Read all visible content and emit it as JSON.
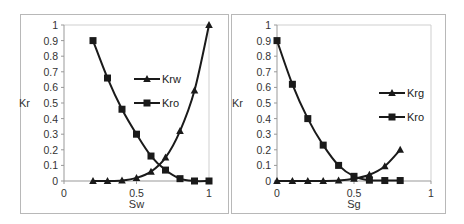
{
  "chart_data": [
    {
      "type": "line",
      "title": "",
      "xlabel": "Sw",
      "ylabel": "Kr",
      "xlim": [
        0,
        1
      ],
      "ylim": [
        0,
        1
      ],
      "x_ticks": [
        "0",
        "0.5",
        "1"
      ],
      "y_ticks": [
        "0",
        "0.1",
        "0.2",
        "0.3",
        "0.4",
        "0.5",
        "0.6",
        "0.7",
        "0.8",
        "0.9",
        "1"
      ],
      "grid": false,
      "legend_position": "inside-right",
      "x": [
        0.2,
        0.3,
        0.4,
        0.5,
        0.6,
        0.7,
        0.8,
        0.9,
        1.0
      ],
      "series": [
        {
          "name": "Krw",
          "marker": "triangle",
          "values": [
            0,
            0,
            0.003,
            0.02,
            0.06,
            0.15,
            0.32,
            0.58,
            1.0
          ]
        },
        {
          "name": "Kro",
          "marker": "square",
          "values": [
            0.9,
            0.66,
            0.46,
            0.3,
            0.16,
            0.07,
            0.015,
            0,
            0
          ]
        }
      ]
    },
    {
      "type": "line",
      "title": "",
      "xlabel": "Sg",
      "ylabel": "Kr",
      "xlim": [
        0,
        1
      ],
      "ylim": [
        0,
        1
      ],
      "x_ticks": [
        "0",
        "0.5",
        "1"
      ],
      "y_ticks": [
        "0",
        "0.1",
        "0.2",
        "0.3",
        "0.4",
        "0.5",
        "0.6",
        "0.7",
        "0.8",
        "0.9",
        "1"
      ],
      "grid": false,
      "legend_position": "inside-right",
      "x": [
        0,
        0.1,
        0.2,
        0.3,
        0.4,
        0.5,
        0.6,
        0.7,
        0.8
      ],
      "series": [
        {
          "name": "Krg",
          "marker": "triangle",
          "values": [
            0,
            0,
            0,
            0,
            0.003,
            0.015,
            0.04,
            0.095,
            0.2
          ]
        },
        {
          "name": "Kro",
          "marker": "square",
          "values": [
            0.9,
            0.62,
            0.4,
            0.23,
            0.1,
            0.03,
            0.005,
            0.003,
            0.003
          ]
        }
      ]
    }
  ],
  "colors": {
    "line": "#1a1a1a",
    "axis": "#999999",
    "frame": "#b8b8b8"
  }
}
